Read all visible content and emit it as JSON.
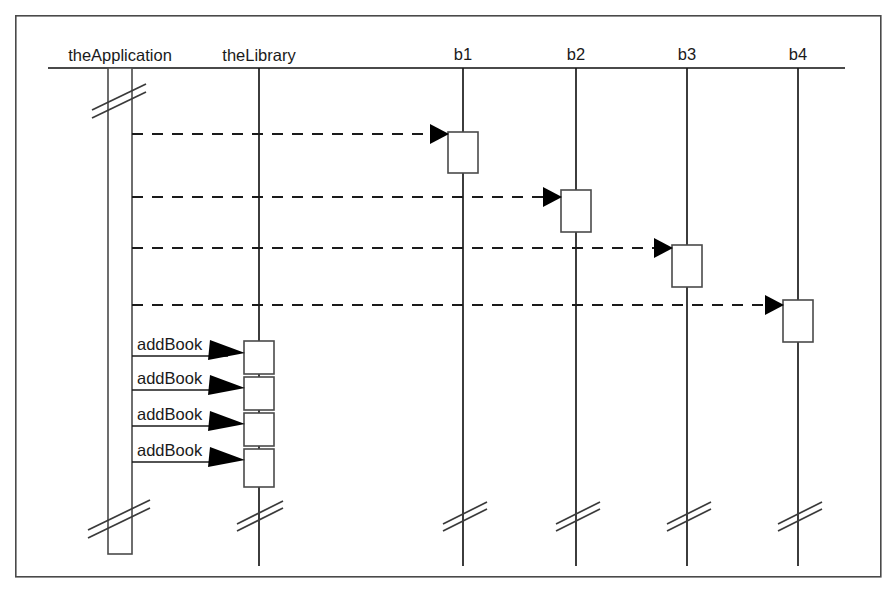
{
  "diagram": {
    "type": "uml-sequence-diagram",
    "title": "",
    "background_color": "#ffffff",
    "line_color": "#1a1a1a",
    "frame": {
      "x": 15,
      "y": 15,
      "width": 866,
      "height": 562
    },
    "header_line": {
      "x1": 48,
      "x2": 845,
      "y": 68
    },
    "lifelines": [
      {
        "id": "theApplication",
        "label": "theApplication",
        "x": 120,
        "label_x": 120,
        "label_y": 61,
        "activation": {
          "x": 108,
          "y": 68,
          "width": 24,
          "height": 486
        },
        "break_mark_y": 100,
        "break_at_bottom_y": 516
      },
      {
        "id": "theLibrary",
        "label": "theLibrary",
        "x": 259,
        "label_x": 259,
        "label_y": 61,
        "lifeline_top": 68,
        "lifeline_bottom": 566,
        "break_at_bottom_y": 516
      },
      {
        "id": "b1",
        "label": "b1",
        "x": 463,
        "label_x": 463,
        "label_y": 57,
        "lifeline_top": 68,
        "lifeline_bottom": 566,
        "break_at_bottom_y": 516,
        "activation": {
          "x": 448,
          "y": 132,
          "width": 30,
          "height": 41
        }
      },
      {
        "id": "b2",
        "label": "b2",
        "x": 576,
        "label_x": 576,
        "label_y": 57,
        "lifeline_top": 68,
        "lifeline_bottom": 566,
        "break_at_bottom_y": 516,
        "activation": {
          "x": 561,
          "y": 190,
          "width": 30,
          "height": 42
        }
      },
      {
        "id": "b3",
        "label": "b3",
        "x": 687,
        "label_x": 687,
        "label_y": 57,
        "lifeline_top": 68,
        "lifeline_bottom": 566,
        "break_at_bottom_y": 516,
        "activation": {
          "x": 672,
          "y": 245,
          "width": 30,
          "height": 42
        }
      },
      {
        "id": "b4",
        "label": "b4",
        "x": 798,
        "label_x": 798,
        "label_y": 57,
        "lifeline_top": 68,
        "lifeline_bottom": 566,
        "break_at_bottom_y": 516,
        "activation": {
          "x": 783,
          "y": 300,
          "width": 30,
          "height": 42
        }
      }
    ],
    "messages": [
      {
        "id": "create-b1",
        "label": "",
        "style": "dashed",
        "from_x": 132,
        "to_x": 448,
        "y": 134,
        "arrow": "filled"
      },
      {
        "id": "create-b2",
        "label": "",
        "style": "dashed",
        "from_x": 132,
        "to_x": 561,
        "y": 197,
        "arrow": "filled"
      },
      {
        "id": "create-b3",
        "label": "",
        "style": "dashed",
        "from_x": 132,
        "to_x": 672,
        "y": 248,
        "arrow": "filled"
      },
      {
        "id": "create-b4",
        "label": "",
        "style": "dashed",
        "from_x": 132,
        "to_x": 783,
        "y": 305,
        "arrow": "filled"
      },
      {
        "id": "addbook-1",
        "label": "addBook",
        "style": "solid",
        "from_x": 132,
        "to_x": 243,
        "y": 356,
        "label_x": 137,
        "label_y": 349,
        "arrow": "filled"
      },
      {
        "id": "addbook-2",
        "label": "addBook",
        "style": "solid",
        "from_x": 132,
        "to_x": 243,
        "y": 388,
        "label_x": 137,
        "label_y": 381,
        "arrow": "filled"
      },
      {
        "id": "addbook-3",
        "label": "addBook",
        "style": "solid",
        "from_x": 132,
        "to_x": 243,
        "y": 423,
        "label_x": 137,
        "label_y": 416,
        "arrow": "filled"
      },
      {
        "id": "addbook-4",
        "label": "addBook",
        "style": "solid",
        "from_x": 132,
        "to_x": 243,
        "y": 458,
        "label_x": 137,
        "label_y": 451,
        "arrow": "filled"
      }
    ],
    "library_activations": [
      {
        "id": "lib-act-1",
        "x": 244,
        "y": 341,
        "width": 30,
        "height": 33
      },
      {
        "id": "lib-act-2",
        "x": 244,
        "y": 377,
        "width": 30,
        "height": 33
      },
      {
        "id": "lib-act-3",
        "x": 244,
        "y": 413,
        "width": 30,
        "height": 33
      },
      {
        "id": "lib-act-4",
        "x": 244,
        "y": 449,
        "width": 30,
        "height": 38
      }
    ]
  }
}
